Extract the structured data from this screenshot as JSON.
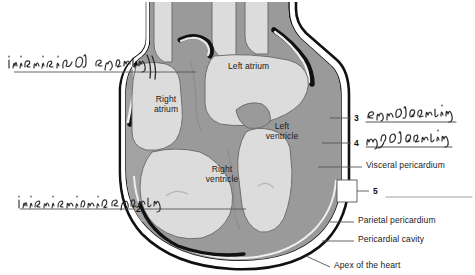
{
  "figure": {
    "colors": {
      "chamber_lumen": "#dcdcdc",
      "myocardium": "#9a9a9a",
      "myocardium_dark": "#8a8a8a",
      "epicardium_line": "#f2f2f2",
      "outline": "#1a1a1a",
      "leader_line": "#555555",
      "handwriting": "#2a2a2a",
      "label_text": "#1a1a1a",
      "background": "#ffffff"
    }
  },
  "chamber_labels": [
    {
      "id": "right-atrium",
      "text": "Right\natrium",
      "x": 143,
      "y": 95,
      "w": 46
    },
    {
      "id": "left-atrium",
      "text": "Left atrium",
      "x": 228,
      "y": 62,
      "w": 64
    },
    {
      "id": "right-ventricle",
      "text": "Right\nventricle",
      "x": 196,
      "y": 165,
      "w": 52
    },
    {
      "id": "left-ventricle",
      "text": "Left\nventricle",
      "x": 258,
      "y": 122,
      "w": 48
    }
  ],
  "printed_labels": [
    {
      "id": "visceral-pericardium",
      "text": "Visceral pericardium",
      "x": 366,
      "y": 164
    },
    {
      "id": "parietal-pericardium",
      "text": "Parietal pericardium",
      "x": 358,
      "y": 219
    },
    {
      "id": "pericardial-cavity",
      "text": "Pericardial cavity",
      "x": 358,
      "y": 238
    },
    {
      "id": "apex-of-the-heart",
      "text": "Apex of the heart",
      "x": 334,
      "y": 264
    }
  ],
  "numbered_blanks": [
    {
      "id": "blank-2",
      "number": "2",
      "x": 138,
      "y": 203
    },
    {
      "id": "blank-3",
      "number": "3",
      "x": 355,
      "y": 115
    },
    {
      "id": "blank-4",
      "number": "4",
      "x": 355,
      "y": 140
    },
    {
      "id": "blank-5",
      "number": "5",
      "x": 372,
      "y": 190
    }
  ],
  "handwritten_answers": [
    {
      "id": "answer-interatrial-septum",
      "text": "interatrial septum",
      "x": 8,
      "y": 56
    },
    {
      "id": "answer-interventricular-septum",
      "text": "interventricular septum",
      "x": 18,
      "y": 196
    },
    {
      "id": "answer-endocardium",
      "text": "endocardium",
      "x": 366,
      "y": 106
    },
    {
      "id": "answer-myocardium",
      "text": "myocardium",
      "x": 366,
      "y": 131
    }
  ],
  "blank_answer_lines": [
    {
      "id": "answer-line-5",
      "x": 386,
      "y": 197,
      "width": 86
    }
  ]
}
